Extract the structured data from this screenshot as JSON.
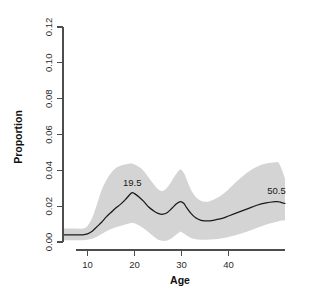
{
  "chart_data": {
    "type": "line",
    "title": "",
    "subtitle": "",
    "xlabel": "Age",
    "ylabel": "Proportion",
    "xlim": [
      5,
      52
    ],
    "ylim": [
      0.0,
      0.12
    ],
    "grid": false,
    "legend": null,
    "x_ticks": [
      10,
      20,
      30,
      40
    ],
    "x_tick_labels": [
      "10",
      "20",
      "30",
      "40"
    ],
    "y_ticks": [
      0.0,
      0.02,
      0.04,
      0.06,
      0.08,
      0.1,
      0.12
    ],
    "y_tick_labels": [
      "0.00",
      "0.02",
      "0.04",
      "0.06",
      "0.08",
      "0.10",
      "0.12"
    ],
    "band_color": "#d4d4d4",
    "line_color": "#1a1a1a",
    "series": [
      {
        "name": "fit",
        "x": [
          5,
          7,
          9,
          10,
          11,
          12,
          13,
          14,
          15,
          16,
          17,
          18,
          19,
          19.5,
          20,
          21,
          22,
          23,
          24,
          25,
          26,
          27,
          28,
          29,
          29.8,
          30.5,
          31,
          32,
          33,
          34,
          35,
          36,
          37,
          38,
          39,
          40,
          42,
          44,
          46,
          48,
          50,
          50.5,
          51,
          52
        ],
        "y": [
          0.004,
          0.004,
          0.004,
          0.0045,
          0.006,
          0.0085,
          0.011,
          0.014,
          0.0165,
          0.019,
          0.021,
          0.0235,
          0.0265,
          0.0275,
          0.027,
          0.025,
          0.0225,
          0.0195,
          0.0175,
          0.016,
          0.0155,
          0.0165,
          0.019,
          0.0215,
          0.0225,
          0.0215,
          0.0195,
          0.016,
          0.0135,
          0.0122,
          0.0118,
          0.0118,
          0.0122,
          0.0128,
          0.0135,
          0.0145,
          0.0165,
          0.0185,
          0.0205,
          0.0218,
          0.0225,
          0.0225,
          0.0222,
          0.0215
        ]
      },
      {
        "name": "upper_ci",
        "x": [
          5,
          7,
          9,
          10,
          11,
          12,
          13,
          14,
          15,
          16,
          17,
          18,
          19,
          19.5,
          20,
          21,
          22,
          23,
          24,
          25,
          26,
          27,
          28,
          29,
          29.8,
          30.5,
          31,
          32,
          33,
          34,
          35,
          36,
          37,
          38,
          39,
          40,
          42,
          44,
          46,
          48,
          50,
          50.5,
          51,
          52
        ],
        "y": [
          0.0075,
          0.0075,
          0.0075,
          0.009,
          0.0135,
          0.021,
          0.029,
          0.0345,
          0.0385,
          0.0412,
          0.0425,
          0.0432,
          0.0438,
          0.0438,
          0.0432,
          0.0418,
          0.0395,
          0.036,
          0.0325,
          0.0295,
          0.0285,
          0.0305,
          0.0345,
          0.0385,
          0.0405,
          0.0385,
          0.0355,
          0.0292,
          0.0252,
          0.0232,
          0.0225,
          0.0228,
          0.0238,
          0.0252,
          0.0272,
          0.0295,
          0.0345,
          0.0388,
          0.042,
          0.0438,
          0.0445,
          0.0445,
          0.0425,
          0.0355
        ]
      },
      {
        "name": "lower_ci",
        "x": [
          5,
          7,
          9,
          10,
          11,
          12,
          13,
          14,
          15,
          16,
          17,
          18,
          19,
          19.5,
          20,
          21,
          22,
          23,
          24,
          25,
          26,
          27,
          28,
          29,
          29.8,
          30.5,
          31,
          32,
          33,
          34,
          35,
          36,
          37,
          38,
          39,
          40,
          42,
          44,
          46,
          48,
          50,
          50.5,
          51,
          52
        ],
        "y": [
          0.001,
          0.001,
          0.001,
          0.0012,
          0.0018,
          0.003,
          0.0045,
          0.006,
          0.0072,
          0.0082,
          0.009,
          0.0098,
          0.0105,
          0.0108,
          0.0105,
          0.0092,
          0.0075,
          0.0055,
          0.0032,
          0.0012,
          0.0005,
          0.0008,
          0.0022,
          0.0045,
          0.0058,
          0.0048,
          0.0038,
          0.0022,
          0.0015,
          0.0012,
          0.0012,
          0.0014,
          0.0016,
          0.0018,
          0.0022,
          0.0028,
          0.0042,
          0.0058,
          0.0078,
          0.0098,
          0.0112,
          0.0115,
          0.0118,
          0.0122
        ]
      }
    ],
    "annotations": [
      {
        "text": "19.5",
        "x": 19.5,
        "y": 0.0315,
        "name": "peak-label-19-5"
      },
      {
        "text": "50.5",
        "x": 50.2,
        "y": 0.0268,
        "name": "peak-label-50-5"
      }
    ]
  }
}
